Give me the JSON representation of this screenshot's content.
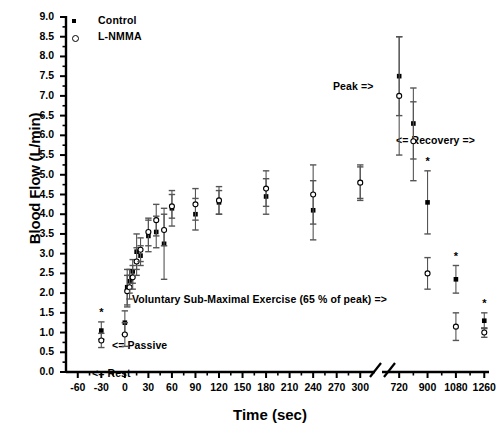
{
  "chart_data": {
    "type": "scatter",
    "title": "",
    "xlabel": "Time (sec)",
    "ylabel": "Blood Flow (L/min)",
    "ylim": [
      0.0,
      9.0
    ],
    "ytick_labels": [
      "0.0",
      "0.5",
      "1.0",
      "1.5",
      "2.0",
      "2.5",
      "3.0",
      "3.5",
      "4.0",
      "4.5",
      "5.0",
      "5.5",
      "6.0",
      "6.5",
      "7.0",
      "7.5",
      "8.0",
      "8.5",
      "9.0"
    ],
    "xtick_labels": [
      "-60",
      "-30",
      "0",
      "30",
      "60",
      "90",
      "120",
      "150",
      "180",
      "210",
      "240",
      "270",
      "300",
      "720",
      "900",
      "1080",
      "1260"
    ],
    "axis_break": true,
    "axis_break_note": "x-axis broken between 300 and 720 sec",
    "grid": false,
    "legend_position": "top-left",
    "error_bars": "SEM",
    "significance_marker": "*",
    "series": [
      {
        "name": "Control",
        "marker": "filled-square",
        "points": [
          {
            "x": -30,
            "y": 1.05,
            "err": 0.22,
            "sig": true
          },
          {
            "x": 0,
            "y": 1.25,
            "err": 0.3,
            "sig": false
          },
          {
            "x": 3,
            "y": 2.15,
            "err": 0.45,
            "sig": false
          },
          {
            "x": 6,
            "y": 2.3,
            "err": 0.3,
            "sig": false
          },
          {
            "x": 10,
            "y": 2.55,
            "err": 0.3,
            "sig": false
          },
          {
            "x": 15,
            "y": 3.05,
            "err": 0.45,
            "sig": false
          },
          {
            "x": 20,
            "y": 2.95,
            "err": 0.25,
            "sig": false
          },
          {
            "x": 30,
            "y": 3.45,
            "err": 0.4,
            "sig": false
          },
          {
            "x": 40,
            "y": 3.55,
            "err": 0.4,
            "sig": false
          },
          {
            "x": 50,
            "y": 3.25,
            "err": 0.9,
            "sig": false
          },
          {
            "x": 60,
            "y": 4.15,
            "err": 0.45,
            "sig": false
          },
          {
            "x": 90,
            "y": 4.0,
            "err": 0.4,
            "sig": false
          },
          {
            "x": 120,
            "y": 4.3,
            "err": 0.3,
            "sig": false
          },
          {
            "x": 180,
            "y": 4.45,
            "err": 0.45,
            "sig": false
          },
          {
            "x": 240,
            "y": 4.1,
            "err": 0.75,
            "sig": false
          },
          {
            "x": 300,
            "y": 4.8,
            "err": 0.45,
            "sig": false
          },
          {
            "x": 720,
            "y": 7.5,
            "err": 1.0,
            "sig": false
          },
          {
            "x": 810,
            "y": 6.3,
            "err": 0.9,
            "sig": false
          },
          {
            "x": 900,
            "y": 4.3,
            "err": 0.8,
            "sig": true
          },
          {
            "x": 1080,
            "y": 2.35,
            "err": 0.35,
            "sig": true
          },
          {
            "x": 1260,
            "y": 1.3,
            "err": 0.2,
            "sig": true
          }
        ]
      },
      {
        "name": "L-NMMA",
        "marker": "open-circle",
        "points": [
          {
            "x": -30,
            "y": 0.8,
            "err": 0.18,
            "sig": false
          },
          {
            "x": 0,
            "y": 0.95,
            "err": 0.3,
            "sig": false
          },
          {
            "x": 3,
            "y": 2.05,
            "err": 0.4,
            "sig": false
          },
          {
            "x": 6,
            "y": 2.15,
            "err": 0.3,
            "sig": false
          },
          {
            "x": 10,
            "y": 2.4,
            "err": 0.3,
            "sig": false
          },
          {
            "x": 15,
            "y": 2.8,
            "err": 0.35,
            "sig": false
          },
          {
            "x": 20,
            "y": 3.1,
            "err": 0.3,
            "sig": false
          },
          {
            "x": 30,
            "y": 3.55,
            "err": 0.35,
            "sig": false
          },
          {
            "x": 40,
            "y": 3.85,
            "err": 0.4,
            "sig": false
          },
          {
            "x": 50,
            "y": 3.6,
            "err": 0.4,
            "sig": false
          },
          {
            "x": 60,
            "y": 4.2,
            "err": 0.3,
            "sig": false
          },
          {
            "x": 90,
            "y": 4.25,
            "err": 0.4,
            "sig": false
          },
          {
            "x": 120,
            "y": 4.35,
            "err": 0.35,
            "sig": false
          },
          {
            "x": 180,
            "y": 4.65,
            "err": 0.45,
            "sig": false
          },
          {
            "x": 240,
            "y": 4.5,
            "err": 0.75,
            "sig": false
          },
          {
            "x": 300,
            "y": 4.8,
            "err": 0.4,
            "sig": false
          },
          {
            "x": 720,
            "y": 7.0,
            "err": 1.5,
            "sig": false
          },
          {
            "x": 810,
            "y": 5.85,
            "err": 1.0,
            "sig": false
          },
          {
            "x": 900,
            "y": 2.5,
            "err": 0.4,
            "sig": false
          },
          {
            "x": 1080,
            "y": 1.15,
            "err": 0.35,
            "sig": false
          },
          {
            "x": 1260,
            "y": 1.0,
            "err": 0.12,
            "sig": false
          }
        ]
      }
    ],
    "annotations": [
      {
        "id": "rest",
        "text": "<= Rest",
        "x": 92,
        "y": 367
      },
      {
        "id": "passive",
        "text": "<= Passive",
        "x": 112,
        "y": 339
      },
      {
        "id": "exercise",
        "text": "Voluntary Sub-Maximal Exercise (65 % of peak)   =>",
        "x": 132,
        "y": 293
      },
      {
        "id": "peak",
        "text": "Peak =>",
        "x": 333,
        "y": 80
      },
      {
        "id": "recovery",
        "text": "<= Recovery =>",
        "x": 396,
        "y": 134
      }
    ]
  },
  "legend": {
    "items": [
      {
        "label": "Control",
        "symbol": "filled-square"
      },
      {
        "label": "L-NMMA",
        "symbol": "open-circle"
      }
    ]
  }
}
